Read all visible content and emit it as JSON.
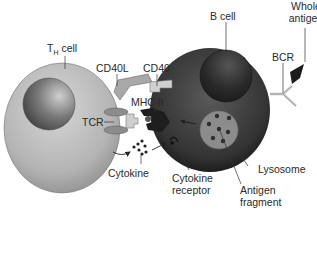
{
  "diagram": {
    "colors": {
      "th_cell_fill": "#b8b8b8",
      "th_nucleus": "#6f6f6f",
      "b_cell_fill": "#3a3a3a",
      "b_nucleus": "#262626",
      "lysosome": "#8c8c8c",
      "antigen_fragment": "#2e2e2e",
      "receptor_light": "#c8c8c8",
      "receptor_dark": "#222222",
      "label_text": "#2a2a2a",
      "background": "#ffffff"
    },
    "labels": {
      "th_cell_main": "T",
      "th_cell_sub": "H",
      "th_cell_rest": " cell",
      "b_cell": "B cell",
      "whole_antigen_line1": "Whole",
      "whole_antigen_line2": "antigen",
      "bcr": "BCR",
      "cd40l": "CD40L",
      "cd40": "CD40",
      "mhc_ii": "MHC II",
      "tcr": "TCR",
      "cytokine": "Cytokine",
      "cytokine_receptor_line1": "Cytokine",
      "cytokine_receptor_line2": "receptor",
      "lysosome": "Lysosome",
      "antigen_fragment_line1": "Antigen",
      "antigen_fragment_line2": "fragment"
    },
    "nodes": [
      {
        "id": "th-cell",
        "label": "TH cell"
      },
      {
        "id": "b-cell",
        "label": "B cell"
      },
      {
        "id": "whole-antigen",
        "label": "Whole antigen"
      },
      {
        "id": "bcr",
        "label": "BCR"
      },
      {
        "id": "cd40l",
        "label": "CD40L"
      },
      {
        "id": "cd40",
        "label": "CD40"
      },
      {
        "id": "mhc-ii",
        "label": "MHC II"
      },
      {
        "id": "tcr",
        "label": "TCR"
      },
      {
        "id": "cytokine",
        "label": "Cytokine"
      },
      {
        "id": "cytokine-receptor",
        "label": "Cytokine receptor"
      },
      {
        "id": "lysosome",
        "label": "Lysosome"
      },
      {
        "id": "antigen-fragment",
        "label": "Antigen fragment"
      }
    ],
    "edges": [
      {
        "from": "cd40l",
        "to": "cd40",
        "type": "binding"
      },
      {
        "from": "tcr",
        "to": "mhc-ii",
        "type": "binding"
      },
      {
        "from": "th-cell",
        "to": "cytokine",
        "type": "secretion-arrow"
      },
      {
        "from": "cytokine",
        "to": "cytokine-receptor",
        "type": "arrow"
      },
      {
        "from": "cytokine-receptor",
        "to": "b-cell",
        "type": "signal-arrow"
      },
      {
        "from": "whole-antigen",
        "to": "bcr",
        "type": "binding"
      }
    ]
  }
}
